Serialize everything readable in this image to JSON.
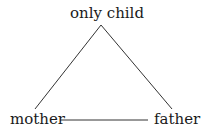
{
  "diagram": {
    "type": "triangle",
    "nodes": {
      "top": "only child",
      "left": "mother",
      "right": "father"
    },
    "edges": [
      {
        "from": "only child",
        "to": "mother"
      },
      {
        "from": "only child",
        "to": "father"
      },
      {
        "from": "mother",
        "to": "father"
      }
    ],
    "line_color": "#333333",
    "text_color": "#1a1a1a"
  }
}
